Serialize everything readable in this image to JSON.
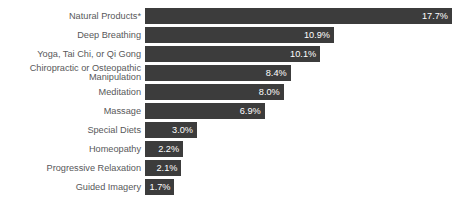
{
  "chart_data": {
    "type": "bar",
    "orientation": "horizontal",
    "title": "",
    "subtitle": "",
    "xlabel": "",
    "ylabel": "",
    "xlim": [
      0,
      17.7
    ],
    "grid": false,
    "legend": null,
    "value_suffix": "%",
    "bar_color": "#3c3c3c",
    "label_color": "#58585a",
    "value_label_color": "#ffffff",
    "background_color": "#ffffff",
    "categories": [
      "Natural Products*",
      "Deep Breathing",
      "Yoga, Tai Chi, or Qi Gong",
      "Chiropractic or Osteopathic\nManipulation",
      "Meditation",
      "Massage",
      "Special Diets",
      "Homeopathy",
      "Progressive Relaxation",
      "Guided Imagery"
    ],
    "values": [
      17.7,
      10.9,
      10.1,
      8.4,
      8.0,
      6.9,
      3.0,
      2.2,
      2.1,
      1.7
    ],
    "value_labels": [
      "17.7%",
      "10.9%",
      "10.1%",
      "8.4%",
      "8.0%",
      "6.9%",
      "3.0%",
      "2.2%",
      "2.1%",
      "1.7%"
    ],
    "bars": [
      {
        "category": "Natural Products*",
        "value": 17.7,
        "value_label": "17.7%",
        "two_line": false
      },
      {
        "category": "Deep Breathing",
        "value": 10.9,
        "value_label": "10.9%",
        "two_line": false
      },
      {
        "category": "Yoga, Tai Chi, or Qi Gong",
        "value": 10.1,
        "value_label": "10.1%",
        "two_line": false
      },
      {
        "category": "Chiropractic or Osteopathic\nManipulation",
        "value": 8.4,
        "value_label": "8.4%",
        "two_line": true
      },
      {
        "category": "Meditation",
        "value": 8.0,
        "value_label": "8.0%",
        "two_line": false
      },
      {
        "category": "Massage",
        "value": 6.9,
        "value_label": "6.9%",
        "two_line": false
      },
      {
        "category": "Special Diets",
        "value": 3.0,
        "value_label": "3.0%",
        "two_line": false
      },
      {
        "category": "Homeopathy",
        "value": 2.2,
        "value_label": "2.2%",
        "two_line": false
      },
      {
        "category": "Progressive Relaxation",
        "value": 2.1,
        "value_label": "2.1%",
        "two_line": false
      },
      {
        "category": "Guided Imagery",
        "value": 1.7,
        "value_label": "1.7%",
        "two_line": false
      }
    ]
  }
}
